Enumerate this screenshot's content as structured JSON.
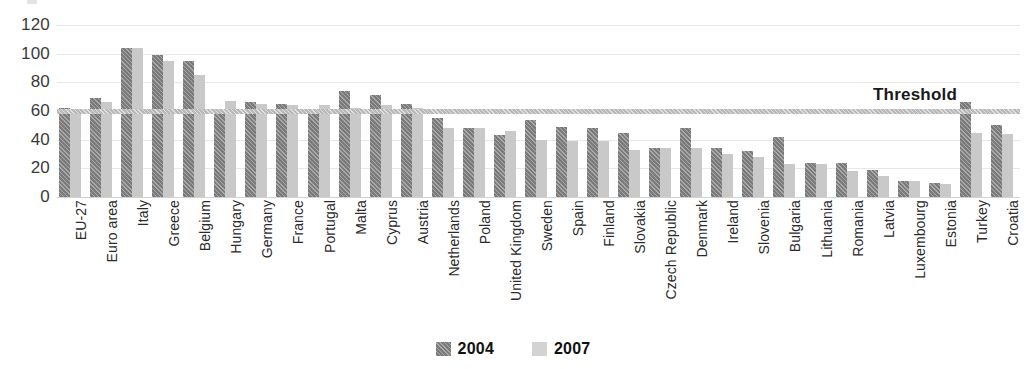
{
  "chart_data": {
    "type": "bar",
    "title": "",
    "xlabel": "",
    "ylabel": "",
    "ylim": [
      0,
      120
    ],
    "yticks": [
      0,
      20,
      40,
      60,
      80,
      100,
      120
    ],
    "grid": true,
    "legend_position": "bottom-center",
    "categories": [
      "EU-27",
      "Euro area",
      "Italy",
      "Greece",
      "Belgium",
      "Hungary",
      "Germany",
      "France",
      "Portugal",
      "Malta",
      "Cyprus",
      "Austria",
      "Netherlands",
      "Poland",
      "United Kingdom",
      "Sweden",
      "Spain",
      "Finland",
      "Slovakia",
      "Czech Republic",
      "Denmark",
      "Ireland",
      "Slovenia",
      "Bulgaria",
      "Lithuania",
      "Romania",
      "Latvia",
      "Luxembourg",
      "Estonia",
      "Turkey",
      "Croatia"
    ],
    "series": [
      {
        "name": "2004",
        "color": "#7b7b7b",
        "values": [
          62,
          69,
          104,
          99,
          95,
          59,
          66,
          65,
          60,
          74,
          71,
          65,
          55,
          48,
          43,
          54,
          49,
          48,
          45,
          34,
          48,
          34,
          32,
          42,
          24,
          24,
          19,
          11,
          10,
          66,
          50
        ]
      },
      {
        "name": "2007",
        "color": "#c9c9c9",
        "values": [
          60,
          66,
          104,
          95,
          85,
          67,
          65,
          64,
          64,
          62,
          64,
          62,
          48,
          48,
          46,
          40,
          39,
          39,
          33,
          34,
          34,
          30,
          28,
          23,
          23,
          18,
          15,
          11,
          9,
          45,
          44
        ]
      }
    ],
    "annotations": [
      {
        "label": "Threshold",
        "value": 60,
        "type": "hline",
        "color": "#b9b9b9"
      }
    ]
  },
  "legend": {
    "items": [
      {
        "label": "2004"
      },
      {
        "label": "2007"
      }
    ]
  },
  "threshold": {
    "label": "Threshold"
  }
}
